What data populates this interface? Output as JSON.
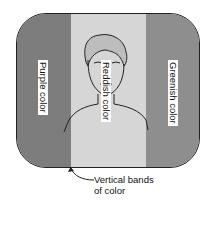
{
  "figure": {
    "bands": [
      {
        "id": "left",
        "label": "Purple color",
        "shade": "#7d7d7d"
      },
      {
        "id": "middle",
        "label": "Reddish color",
        "shade": "#d6d6d6"
      },
      {
        "id": "right",
        "label": "Greenish color",
        "shade": "#8e8e8e"
      }
    ],
    "caption_line1": "Vertical bands",
    "caption_line2": "of color"
  }
}
